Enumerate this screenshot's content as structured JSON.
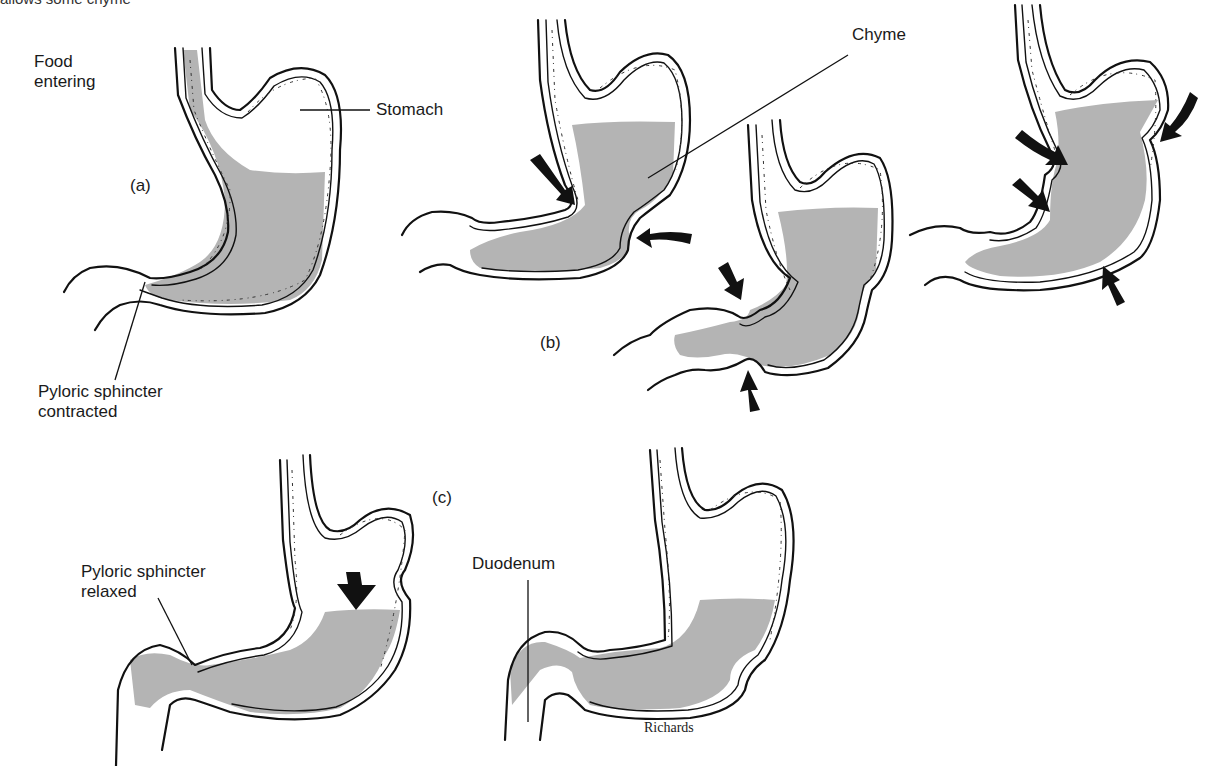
{
  "top_caption_fragment": "allows some chyme",
  "labels": {
    "food_entering": [
      "Food",
      "entering"
    ],
    "stomach": "Stomach",
    "chyme": "Chyme",
    "pyloric_contracted": [
      "Pyloric sphincter",
      "contracted"
    ],
    "pyloric_relaxed": [
      "Pyloric sphincter",
      "relaxed"
    ],
    "duodenum": "Duodenum"
  },
  "panels": {
    "a": "(a)",
    "b": "(b)",
    "c": "(c)"
  },
  "credit": "Richards",
  "colors": {
    "chyme_fill": "#b4b4b4",
    "outline": "#111111",
    "background": "#ffffff"
  },
  "figure": {
    "stages": [
      {
        "id": "a",
        "description": "Food entering stomach; pyloric sphincter contracted"
      },
      {
        "id": "b",
        "description": "Peristaltic contraction waves mix food into chyme (3 stomach views with arrows)"
      },
      {
        "id": "c",
        "description": "Pyloric sphincter relaxed; chyme pushed into duodenum (2 stomach views)"
      }
    ]
  }
}
